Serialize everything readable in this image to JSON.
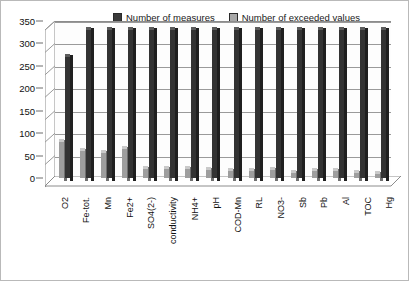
{
  "chart_data": {
    "type": "bar",
    "title": "",
    "subtitle": "",
    "xlabel": "",
    "ylabel": "",
    "ylim": [
      0,
      350
    ],
    "yticks": [
      0,
      50,
      100,
      150,
      200,
      250,
      300,
      350
    ],
    "grid": true,
    "legend_position": "top",
    "style": "3d-clustered-column",
    "categories": [
      "O2",
      "Fe-tot.",
      "Mn",
      "Fe2+",
      "SO4(2-)",
      "conductivity",
      "NH4+",
      "pH",
      "COD-Mn",
      "RL",
      "NO3-",
      "Sb",
      "Pb",
      "Al",
      "TOC",
      "Hg"
    ],
    "series": [
      {
        "name": "Number of measures",
        "color": "#333333",
        "values": [
          270,
          330,
          330,
          330,
          330,
          330,
          330,
          330,
          330,
          330,
          330,
          330,
          330,
          330,
          330,
          330
        ]
      },
      {
        "name": "Number of exceeded values",
        "color": "#9e9e9e",
        "values": [
          80,
          60,
          55,
          65,
          20,
          20,
          20,
          18,
          15,
          15,
          18,
          12,
          15,
          15,
          12,
          10
        ]
      }
    ]
  },
  "legend": {
    "entries": [
      {
        "label": "Number of measures",
        "swatch": "dark-gray-swatch"
      },
      {
        "label": "Number of exceeded values",
        "swatch": "light-gray-swatch"
      }
    ]
  },
  "axis": {
    "y_tick_labels": [
      "350",
      "300",
      "250",
      "200",
      "150",
      "100",
      "50",
      "0"
    ]
  },
  "colors": {
    "series_measures": "#333333",
    "series_exceeded": "#9e9e9e",
    "gridline": "#9a9a9a",
    "axis": "#6d6d6d",
    "plot_background": "#fdfdfd",
    "page_background": "#ffffff"
  }
}
